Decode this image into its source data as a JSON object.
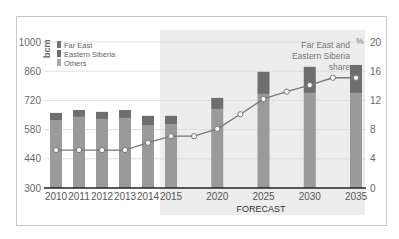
{
  "chart_data": {
    "type": "bar",
    "subtype": "stacked bar with line overlay (dual axis)",
    "categories": [
      "2010",
      "2011",
      "2012",
      "2013",
      "2014",
      "2015",
      "2020",
      "2025",
      "2030",
      "2035"
    ],
    "series": [
      {
        "name": "Others",
        "axis": "left",
        "color": "#9a9a9a",
        "values": [
          626,
          641,
          631,
          636,
          602,
          607,
          679,
          751,
          756,
          756
        ]
      },
      {
        "name": "Eastern Siberia",
        "axis": "left",
        "color": "#6e6e6e",
        "values": [
          34,
          33,
          34,
          38,
          44,
          39,
          53,
          106,
          125,
          134
        ]
      },
      {
        "name": "Far East",
        "axis": "left",
        "color": "#767676",
        "values": [
          0,
          0,
          0,
          0,
          0,
          0,
          0,
          0,
          0,
          0
        ]
      }
    ],
    "line_series": {
      "name": "Far East and Eastern Siberia share",
      "axis": "right",
      "x": [
        2010,
        2011,
        2012,
        2013,
        2014,
        2015,
        2017.5,
        2020,
        2022.5,
        2025,
        2027.5,
        2030,
        2032.5,
        2035
      ],
      "values": [
        5.2,
        5.2,
        5.2,
        5.2,
        6.2,
        7.1,
        7.1,
        8.1,
        10.1,
        12.2,
        13.2,
        14.1,
        15.1,
        15.1
      ]
    },
    "title": "",
    "left_axis": {
      "label": "bcm",
      "ticks": [
        300,
        440,
        580,
        720,
        860,
        1000
      ],
      "range": [
        300,
        1000
      ]
    },
    "right_axis": {
      "label": "%",
      "ticks": [
        0,
        4,
        8,
        12,
        16,
        20
      ],
      "range": [
        0,
        20
      ]
    },
    "xlabel": "FORECAST",
    "legend": [
      "Far East",
      "Eastern Siberia",
      "Others"
    ],
    "legend_position": "top-left",
    "annotation": "Far East and Eastern Siberia share",
    "forecast_region": [
      "2015",
      "2035"
    ],
    "grid": true
  },
  "labels": {
    "unit_left": "bcm",
    "unit_right": "%",
    "forecast": "FORECAST",
    "annotation_lines": [
      "Far East and",
      "Eastern Siberia",
      "share"
    ],
    "legend": [
      {
        "label": "Far East",
        "color": "#777777"
      },
      {
        "label": "Eastern Siberia",
        "color": "#6a6a6a"
      },
      {
        "label": "Others",
        "color": "#a8a8a8"
      }
    ]
  }
}
